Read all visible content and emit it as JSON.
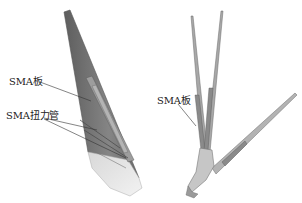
{
  "left_panel": {
    "labels": [
      {
        "id": "sma-plate",
        "text": "SMA板",
        "x": 9,
        "y": 77
      },
      {
        "id": "sma-torque-tube",
        "text": "SMA扭力管",
        "x": 6,
        "y": 111
      }
    ]
  },
  "right_panel": {
    "labels": [
      {
        "id": "sma-plate-right",
        "text": "SMA板",
        "x": 157,
        "y": 96
      }
    ]
  },
  "colors": {
    "wing_dark": "#6f6f6f",
    "wing_mid": "#8c8c8c",
    "wing_light": "#bdbdbd",
    "leader_line": "#333333",
    "frame": "#9a9a9a"
  }
}
